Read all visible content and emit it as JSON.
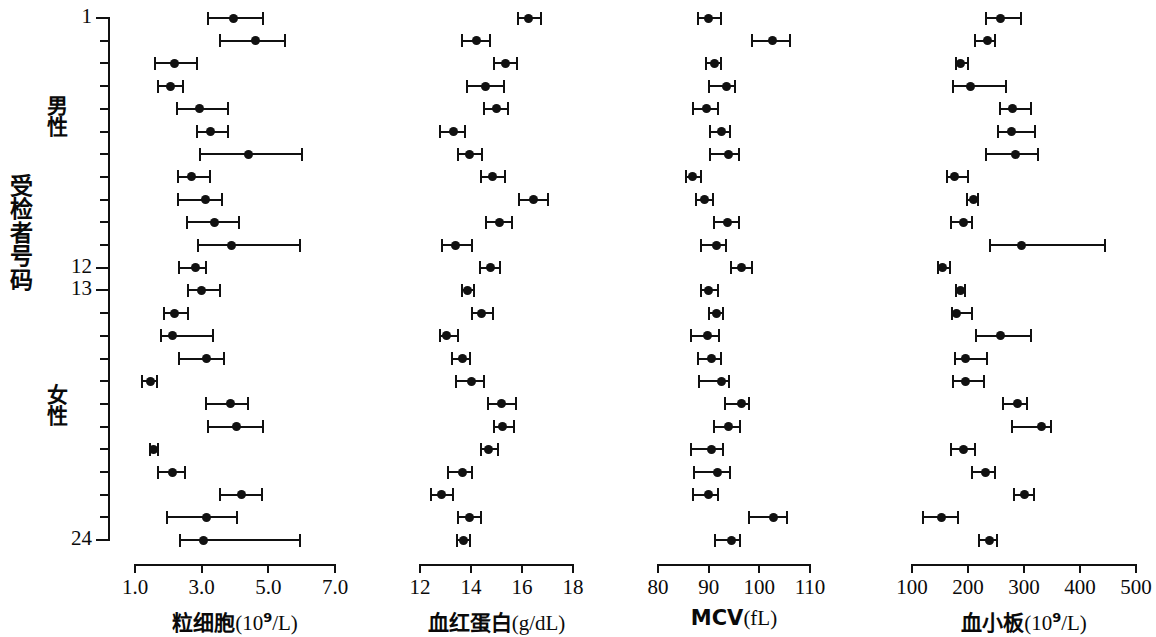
{
  "axes": {
    "y_title": "受检者号码",
    "y_tick_labels": [
      {
        "subject": 1,
        "label": "1"
      },
      {
        "subject": 12,
        "label": "12"
      },
      {
        "subject": 13,
        "label": "13"
      },
      {
        "subject": 24,
        "label": "24"
      }
    ],
    "groups": [
      {
        "name": "male",
        "label": "男性",
        "subjects": [
          1,
          12
        ]
      },
      {
        "name": "female",
        "label": "女性",
        "subjects": [
          13,
          24
        ]
      }
    ],
    "n_subjects": 24
  },
  "chart_data": {
    "type": "scatter",
    "plot_style": "dot-and-whisker (mean with range) multi-panel",
    "title": "",
    "ylabel": "受检者号码",
    "y_categories": [
      1,
      2,
      3,
      4,
      5,
      6,
      7,
      8,
      9,
      10,
      11,
      12,
      13,
      14,
      15,
      16,
      17,
      18,
      19,
      20,
      21,
      22,
      23,
      24
    ],
    "y_tick_labels": [
      "1",
      "12",
      "13",
      "24"
    ],
    "group_labels": [
      "男性",
      "女性"
    ],
    "grid": false,
    "legend": "none",
    "panels": [
      {
        "id": "granulocytes",
        "xlabel": "粒细胞(10⁹/L)",
        "xlabel_text": "粒细胞",
        "xlabel_unit": "(10",
        "xlabel_exp": "9",
        "xlabel_unit2": "/L)",
        "xlim": [
          1.0,
          7.0
        ],
        "xticks": [
          1.0,
          3.0,
          5.0,
          7.0
        ],
        "xtick_labels": [
          "1.0",
          "3.0",
          "5.0",
          "7.0"
        ],
        "points": [
          {
            "subject": 1,
            "value": 3.95,
            "low": 3.2,
            "high": 4.85
          },
          {
            "subject": 2,
            "value": 4.62,
            "low": 3.55,
            "high": 5.5
          },
          {
            "subject": 3,
            "value": 2.18,
            "low": 1.6,
            "high": 2.85
          },
          {
            "subject": 4,
            "value": 2.05,
            "low": 1.7,
            "high": 2.45
          },
          {
            "subject": 5,
            "value": 2.92,
            "low": 2.25,
            "high": 3.8
          },
          {
            "subject": 6,
            "value": 3.25,
            "low": 2.85,
            "high": 3.78
          },
          {
            "subject": 7,
            "value": 4.4,
            "low": 2.95,
            "high": 6.0
          },
          {
            "subject": 8,
            "value": 2.7,
            "low": 2.3,
            "high": 3.25
          },
          {
            "subject": 9,
            "value": 3.12,
            "low": 2.28,
            "high": 3.62
          },
          {
            "subject": 10,
            "value": 3.38,
            "low": 2.55,
            "high": 4.12
          },
          {
            "subject": 11,
            "value": 3.9,
            "low": 2.88,
            "high": 5.95
          },
          {
            "subject": 12,
            "value": 2.8,
            "low": 2.32,
            "high": 3.12
          },
          {
            "subject": 13,
            "value": 3.0,
            "low": 2.6,
            "high": 3.55
          },
          {
            "subject": 14,
            "value": 2.18,
            "low": 1.88,
            "high": 2.6
          },
          {
            "subject": 15,
            "value": 2.12,
            "low": 1.78,
            "high": 3.35
          },
          {
            "subject": 16,
            "value": 3.15,
            "low": 2.32,
            "high": 3.68
          },
          {
            "subject": 17,
            "value": 1.45,
            "low": 1.22,
            "high": 1.65
          },
          {
            "subject": 18,
            "value": 3.85,
            "low": 3.12,
            "high": 4.4
          },
          {
            "subject": 19,
            "value": 4.05,
            "low": 3.2,
            "high": 4.85
          },
          {
            "subject": 20,
            "value": 1.55,
            "low": 1.45,
            "high": 1.7
          },
          {
            "subject": 21,
            "value": 2.12,
            "low": 1.68,
            "high": 2.5
          },
          {
            "subject": 22,
            "value": 4.18,
            "low": 3.55,
            "high": 4.8
          },
          {
            "subject": 23,
            "value": 3.15,
            "low": 1.95,
            "high": 4.05
          },
          {
            "subject": 24,
            "value": 3.05,
            "low": 2.35,
            "high": 5.95
          }
        ]
      },
      {
        "id": "hemoglobin",
        "xlabel": "血红蛋白(g/dL)",
        "xlabel_text": "血红蛋白",
        "xlabel_unit": "(g/dL)",
        "xlim": [
          12,
          18
        ],
        "xticks": [
          12,
          14,
          16,
          18
        ],
        "xtick_labels": [
          "12",
          "14",
          "16",
          "18"
        ],
        "points": [
          {
            "subject": 1,
            "value": 16.25,
            "low": 15.85,
            "high": 16.75
          },
          {
            "subject": 2,
            "value": 14.2,
            "low": 13.65,
            "high": 14.75
          },
          {
            "subject": 3,
            "value": 15.35,
            "low": 14.9,
            "high": 15.8
          },
          {
            "subject": 4,
            "value": 14.55,
            "low": 13.85,
            "high": 15.3
          },
          {
            "subject": 5,
            "value": 15.0,
            "low": 14.5,
            "high": 15.45
          },
          {
            "subject": 6,
            "value": 13.3,
            "low": 12.8,
            "high": 13.75
          },
          {
            "subject": 7,
            "value": 13.95,
            "low": 13.5,
            "high": 14.45
          },
          {
            "subject": 8,
            "value": 14.85,
            "low": 14.4,
            "high": 15.35
          },
          {
            "subject": 9,
            "value": 16.45,
            "low": 15.9,
            "high": 17.0
          },
          {
            "subject": 10,
            "value": 15.1,
            "low": 14.6,
            "high": 15.6
          },
          {
            "subject": 11,
            "value": 13.4,
            "low": 12.85,
            "high": 14.05
          },
          {
            "subject": 12,
            "value": 14.75,
            "low": 14.35,
            "high": 15.15
          },
          {
            "subject": 13,
            "value": 13.85,
            "low": 13.65,
            "high": 14.1
          },
          {
            "subject": 14,
            "value": 14.4,
            "low": 14.05,
            "high": 14.85
          },
          {
            "subject": 15,
            "value": 13.05,
            "low": 12.8,
            "high": 13.5
          },
          {
            "subject": 16,
            "value": 13.65,
            "low": 13.25,
            "high": 13.95
          },
          {
            "subject": 17,
            "value": 14.0,
            "low": 13.4,
            "high": 14.5
          },
          {
            "subject": 18,
            "value": 15.2,
            "low": 14.65,
            "high": 15.75
          },
          {
            "subject": 19,
            "value": 15.25,
            "low": 14.9,
            "high": 15.7
          },
          {
            "subject": 20,
            "value": 14.7,
            "low": 14.4,
            "high": 15.05
          },
          {
            "subject": 21,
            "value": 13.65,
            "low": 13.1,
            "high": 14.05
          },
          {
            "subject": 22,
            "value": 12.85,
            "low": 12.45,
            "high": 13.3
          },
          {
            "subject": 23,
            "value": 13.95,
            "low": 13.5,
            "high": 14.4
          },
          {
            "subject": 24,
            "value": 13.7,
            "low": 13.45,
            "high": 13.95
          }
        ]
      },
      {
        "id": "mcv",
        "xlabel": "MCV(fL)",
        "xlabel_text": "MCV",
        "xlabel_unit": "(fL)",
        "xlim": [
          80,
          110
        ],
        "xticks": [
          80,
          90,
          100,
          110
        ],
        "xtick_labels": [
          "80",
          "90",
          "100",
          "110"
        ],
        "points": [
          {
            "subject": 1,
            "value": 90.0,
            "low": 87.8,
            "high": 92.5
          },
          {
            "subject": 2,
            "value": 102.5,
            "low": 98.5,
            "high": 106.0
          },
          {
            "subject": 3,
            "value": 91.2,
            "low": 89.5,
            "high": 92.5
          },
          {
            "subject": 4,
            "value": 93.5,
            "low": 90.0,
            "high": 95.2
          },
          {
            "subject": 5,
            "value": 89.5,
            "low": 87.0,
            "high": 91.8
          },
          {
            "subject": 6,
            "value": 92.5,
            "low": 90.2,
            "high": 94.2
          },
          {
            "subject": 7,
            "value": 94.0,
            "low": 90.2,
            "high": 96.0
          },
          {
            "subject": 8,
            "value": 86.8,
            "low": 85.5,
            "high": 88.5
          },
          {
            "subject": 9,
            "value": 89.2,
            "low": 87.5,
            "high": 90.8
          },
          {
            "subject": 10,
            "value": 93.8,
            "low": 91.0,
            "high": 96.0
          },
          {
            "subject": 11,
            "value": 91.5,
            "low": 88.5,
            "high": 93.5
          },
          {
            "subject": 12,
            "value": 96.5,
            "low": 94.5,
            "high": 98.5
          },
          {
            "subject": 13,
            "value": 90.0,
            "low": 88.5,
            "high": 91.8
          },
          {
            "subject": 14,
            "value": 91.5,
            "low": 90.0,
            "high": 92.8
          },
          {
            "subject": 15,
            "value": 89.8,
            "low": 86.5,
            "high": 92.0
          },
          {
            "subject": 16,
            "value": 90.5,
            "low": 87.8,
            "high": 92.5
          },
          {
            "subject": 17,
            "value": 92.5,
            "low": 88.0,
            "high": 94.0
          },
          {
            "subject": 18,
            "value": 96.5,
            "low": 93.2,
            "high": 98.0
          },
          {
            "subject": 19,
            "value": 94.0,
            "low": 91.0,
            "high": 96.2
          },
          {
            "subject": 20,
            "value": 90.5,
            "low": 86.5,
            "high": 92.8
          },
          {
            "subject": 21,
            "value": 91.8,
            "low": 87.2,
            "high": 94.2
          },
          {
            "subject": 22,
            "value": 90.0,
            "low": 87.0,
            "high": 91.8
          },
          {
            "subject": 23,
            "value": 102.8,
            "low": 98.0,
            "high": 105.5
          },
          {
            "subject": 24,
            "value": 94.5,
            "low": 91.2,
            "high": 96.2
          }
        ]
      },
      {
        "id": "platelets",
        "xlabel": "血小板(10⁹/L)",
        "xlabel_text": "血小板",
        "xlabel_unit": "(10",
        "xlabel_exp": "9",
        "xlabel_unit2": "/L)",
        "xlim": [
          100,
          500
        ],
        "xticks": [
          100,
          200,
          300,
          400,
          500
        ],
        "xtick_labels": [
          "100",
          "200",
          "300",
          "400",
          "500"
        ],
        "points": [
          {
            "subject": 1,
            "value": 258,
            "low": 232,
            "high": 295
          },
          {
            "subject": 2,
            "value": 234,
            "low": 212,
            "high": 248
          },
          {
            "subject": 3,
            "value": 187,
            "low": 178,
            "high": 200
          },
          {
            "subject": 4,
            "value": 204,
            "low": 173,
            "high": 268
          },
          {
            "subject": 5,
            "value": 280,
            "low": 258,
            "high": 312
          },
          {
            "subject": 6,
            "value": 278,
            "low": 254,
            "high": 320
          },
          {
            "subject": 7,
            "value": 285,
            "low": 232,
            "high": 325
          },
          {
            "subject": 8,
            "value": 176,
            "low": 162,
            "high": 200
          },
          {
            "subject": 9,
            "value": 209,
            "low": 198,
            "high": 218
          },
          {
            "subject": 10,
            "value": 192,
            "low": 170,
            "high": 208
          },
          {
            "subject": 11,
            "value": 295,
            "low": 240,
            "high": 445
          },
          {
            "subject": 12,
            "value": 154,
            "low": 146,
            "high": 168
          },
          {
            "subject": 13,
            "value": 186,
            "low": 178,
            "high": 194
          },
          {
            "subject": 14,
            "value": 180,
            "low": 172,
            "high": 208
          },
          {
            "subject": 15,
            "value": 258,
            "low": 215,
            "high": 312
          },
          {
            "subject": 16,
            "value": 196,
            "low": 176,
            "high": 234
          },
          {
            "subject": 17,
            "value": 196,
            "low": 174,
            "high": 228
          },
          {
            "subject": 18,
            "value": 288,
            "low": 262,
            "high": 306
          },
          {
            "subject": 19,
            "value": 332,
            "low": 278,
            "high": 348
          },
          {
            "subject": 20,
            "value": 192,
            "low": 170,
            "high": 212
          },
          {
            "subject": 21,
            "value": 232,
            "low": 208,
            "high": 248
          },
          {
            "subject": 22,
            "value": 301,
            "low": 282,
            "high": 318
          },
          {
            "subject": 23,
            "value": 152,
            "low": 120,
            "high": 182
          },
          {
            "subject": 24,
            "value": 238,
            "low": 220,
            "high": 252
          }
        ]
      }
    ]
  }
}
